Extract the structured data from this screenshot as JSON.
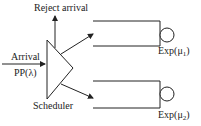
{
  "labels": {
    "reject": "Reject arrival",
    "arrival": "Arrival",
    "process": "PP(λ)",
    "scheduler": "Scheduler",
    "server1_prefix": "Exp(μ",
    "server1_sub": "1",
    "server1_suffix": ")",
    "server2_prefix": "Exp(μ",
    "server2_sub": "2",
    "server2_suffix": ")"
  },
  "colors": {
    "stroke": "#222222"
  }
}
